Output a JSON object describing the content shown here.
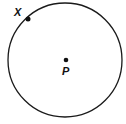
{
  "diagram": {
    "type": "circle-with-center-and-point",
    "circle": {
      "cx": 65,
      "cy": 60,
      "r": 57,
      "stroke": "#1a1a1a"
    },
    "points": [
      {
        "id": "X",
        "label": "X",
        "x": 28,
        "y": 19,
        "label_x": 14,
        "label_y": 16
      },
      {
        "id": "P",
        "label": "P",
        "x": 66,
        "y": 60,
        "label_x": 62,
        "label_y": 75
      }
    ]
  }
}
